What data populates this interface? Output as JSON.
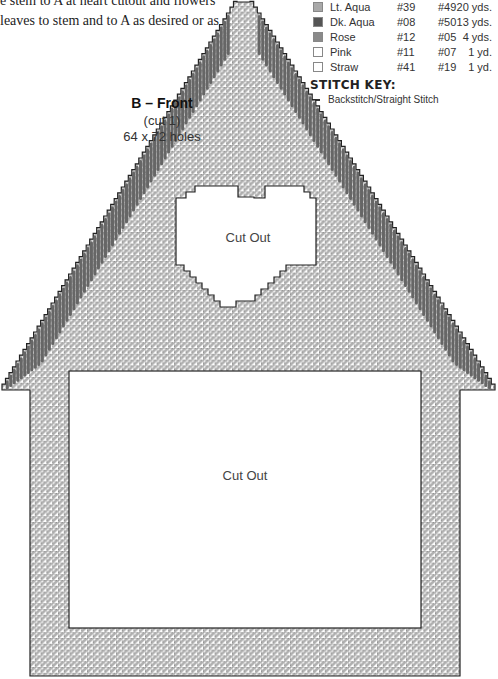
{
  "instructions": {
    "line1": "e stem to A at heart cutout and flowers",
    "line2": "leaves to stem and to A as desired or as"
  },
  "color_key": {
    "rows": [
      {
        "name": "Lt. Aqua",
        "code1": "#39",
        "code2": "#49",
        "amount": "20 yds.",
        "swatch": "#a9a9a9"
      },
      {
        "name": "Dk. Aqua",
        "code1": "#08",
        "code2": "#50",
        "amount": "13 yds.",
        "swatch": "#555555"
      },
      {
        "name": "Rose",
        "code1": "#12",
        "code2": "#05",
        "amount": "4 yds.",
        "swatch": "#8a8a8a"
      },
      {
        "name": "Pink",
        "code1": "#11",
        "code2": "#07",
        "amount": "1 yd.",
        "swatch": "#ffffff"
      },
      {
        "name": "Straw",
        "code1": "#41",
        "code2": "#19",
        "amount": "1 yd.",
        "swatch": "#ffffff"
      }
    ]
  },
  "stitch_key": {
    "title": "STITCH KEY:",
    "items": [
      {
        "label": "Backstitch/Straight Stitch"
      }
    ]
  },
  "piece": {
    "title": "B – Front",
    "cut": "(cut 1)",
    "size": "64 x 72 holes",
    "heart_cutout_label": "Cut Out",
    "main_cutout_label": "Cut Out"
  },
  "colors": {
    "grid_line": "#222222",
    "fill_light": "#b8b8b8",
    "backstitch": "#555555"
  }
}
